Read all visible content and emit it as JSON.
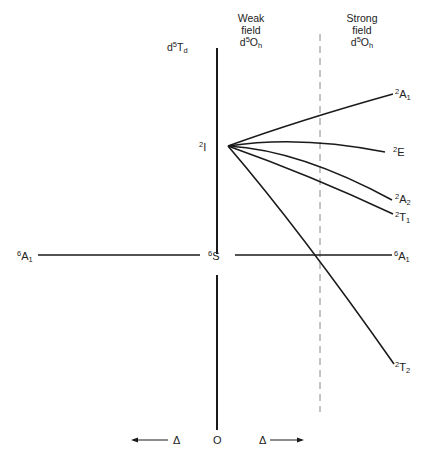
{
  "headers": {
    "tetrahedral": {
      "base": "d",
      "sup": "5",
      "sym": "T",
      "sub": "d"
    },
    "weak_field": {
      "line1": "Weak",
      "line2": "field",
      "base": "d",
      "sup": "5",
      "sym": "O",
      "sub": "h"
    },
    "strong_field": {
      "line1": "Strong",
      "line2": "field",
      "base": "d",
      "sup": "5",
      "sym": "O",
      "sub": "h"
    }
  },
  "free_ion_terms": {
    "doublet_I": {
      "sup": "2",
      "sym": "I"
    },
    "sextet_S": {
      "sup": "6",
      "sym": "S"
    }
  },
  "left_terms": {
    "sextet_A1": {
      "sup": "6",
      "sym": "A",
      "sub": "1"
    }
  },
  "right_terms": {
    "A1_doublet": {
      "sup": "2",
      "sym": "A",
      "sub": "1"
    },
    "E_doublet": {
      "sup": "2",
      "sym": "E",
      "sub": ""
    },
    "A2_doublet": {
      "sup": "2",
      "sym": "A",
      "sub": "2"
    },
    "T1_doublet": {
      "sup": "2",
      "sym": "T",
      "sub": "1"
    },
    "sextet_A1": {
      "sup": "6",
      "sym": "A",
      "sub": "1"
    },
    "T2_doublet": {
      "sup": "2",
      "sym": "T",
      "sub": "2"
    }
  },
  "axis": {
    "left_delta": "Δ",
    "origin": "O",
    "right_delta": "Δ"
  },
  "colors": {
    "line": "#1a1a1a",
    "dashed": "#888888",
    "background": "#ffffff"
  }
}
